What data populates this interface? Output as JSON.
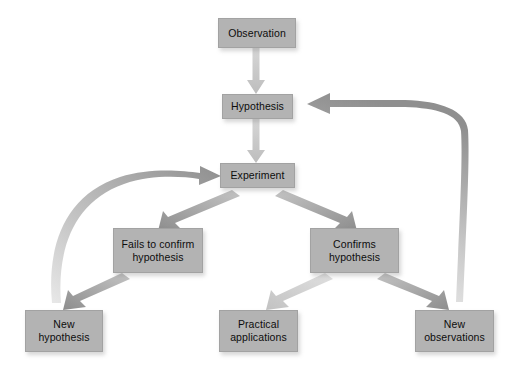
{
  "diagram": {
    "type": "flowchart",
    "background_color": "#ffffff",
    "node_fill_color": "#b3b3b3",
    "node_text_color": "#0d0d0d",
    "arrow_color_light": "#c9c9c9",
    "arrow_color_mid": "#9a9a9a",
    "arrow_color_dark": "#8c8c8c",
    "nodes": [
      {
        "id": "observation",
        "label": "Observation",
        "x": 218,
        "y": 18,
        "w": 78,
        "h": 30
      },
      {
        "id": "hypothesis",
        "label": "Hypothesis",
        "x": 222,
        "y": 94,
        "w": 71,
        "h": 25
      },
      {
        "id": "experiment",
        "label": "Experiment",
        "x": 220,
        "y": 163,
        "w": 75,
        "h": 25
      },
      {
        "id": "fails",
        "label": "Fails to confirm hypothesis",
        "x": 113,
        "y": 228,
        "w": 90,
        "h": 45
      },
      {
        "id": "confirms",
        "label": "Confirms hypothesis",
        "x": 310,
        "y": 228,
        "w": 89,
        "h": 45
      },
      {
        "id": "new-hypothesis",
        "label": "New hypothesis",
        "x": 25,
        "y": 310,
        "w": 78,
        "h": 42
      },
      {
        "id": "practical",
        "label": "Practical applications",
        "x": 219,
        "y": 310,
        "w": 79,
        "h": 42
      },
      {
        "id": "new-observations",
        "label": "New observations",
        "x": 415,
        "y": 310,
        "w": 79,
        "h": 42
      }
    ],
    "node_labels": {
      "observation": "Observation",
      "hypothesis": "Hypothesis",
      "experiment": "Experiment",
      "fails_line1": "Fails to confirm",
      "fails_line2": "hypothesis",
      "confirms_line1": "Confirms",
      "confirms_line2": "hypothesis",
      "new_hypothesis_line1": "New",
      "new_hypothesis_line2": "hypothesis",
      "practical_line1": "Practical",
      "practical_line2": "applications",
      "new_observations_line1": "New",
      "new_observations_line2": "observations"
    },
    "edges": [
      {
        "id": "obs-to-hyp",
        "from": "observation",
        "to": "hypothesis",
        "style": "straight-down",
        "shade": "light"
      },
      {
        "id": "hyp-to-exp",
        "from": "hypothesis",
        "to": "experiment",
        "style": "straight-down",
        "shade": "light"
      },
      {
        "id": "exp-to-fails",
        "from": "experiment",
        "to": "fails",
        "style": "diagonal",
        "shade": "mid"
      },
      {
        "id": "exp-to-confirms",
        "from": "experiment",
        "to": "confirms",
        "style": "diagonal",
        "shade": "mid"
      },
      {
        "id": "fails-to-newhyp",
        "from": "fails",
        "to": "new-hypothesis",
        "style": "diagonal",
        "shade": "mid"
      },
      {
        "id": "confirms-to-practical",
        "from": "confirms",
        "to": "practical",
        "style": "diagonal",
        "shade": "light"
      },
      {
        "id": "confirms-to-newobs",
        "from": "confirms",
        "to": "new-observations",
        "style": "diagonal",
        "shade": "mid"
      },
      {
        "id": "newhyp-to-experiment",
        "from": "new-hypothesis",
        "to": "experiment",
        "style": "curved-feedback-left",
        "shade": "mid"
      },
      {
        "id": "newobs-to-hypothesis",
        "from": "new-observations",
        "to": "hypothesis",
        "style": "curved-feedback-right",
        "shade": "mid"
      }
    ]
  }
}
